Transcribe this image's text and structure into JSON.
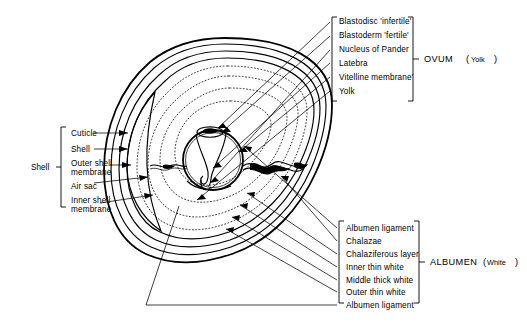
{
  "figure": {
    "background_color": "#ffffff",
    "ink_color": "#000000"
  },
  "groups": {
    "shell": {
      "group_label": "Shell",
      "bracket_side": "left",
      "items": [
        {
          "label": "Cuticle"
        },
        {
          "label": "Shell"
        },
        {
          "label": "Outer shell",
          "label2": "membrane"
        },
        {
          "label": "Air sac"
        },
        {
          "label": "Inner shell",
          "label2": "membrane"
        }
      ]
    },
    "ovum": {
      "group_label": "OVUM",
      "group_label_paren_open": "(",
      "group_label_sub": "Yolk",
      "group_label_paren_close": ")",
      "bracket_side": "right",
      "items": [
        {
          "label": "Blastodisc 'infertile'"
        },
        {
          "label": "Blastoderm 'fertile'"
        },
        {
          "label": "Nucleus of Pander"
        },
        {
          "label": "Latebra"
        },
        {
          "label": "Vitelline membrane'"
        },
        {
          "label": "Yolk"
        }
      ]
    },
    "albumen": {
      "group_label": "ALBUMEN",
      "group_label_paren_open": "(",
      "group_label_sub": "White",
      "group_label_paren_close": ")",
      "bracket_side": "right",
      "items": [
        {
          "label": "Albumen ligament"
        },
        {
          "label": "Chalazae"
        },
        {
          "label": "Chalaziferous layer"
        },
        {
          "label": "Inner thin  white"
        },
        {
          "label": "Middle thick  white"
        },
        {
          "label": "Outer thin  white"
        },
        {
          "label": "Albumen ligament"
        }
      ]
    }
  },
  "diagram": {
    "parts": [
      "egg-outline",
      "shell-layers",
      "air-sac",
      "albumen-layers",
      "yolk-sphere",
      "latebra",
      "blastodisc",
      "chalaza-left",
      "chalaza-right"
    ]
  }
}
